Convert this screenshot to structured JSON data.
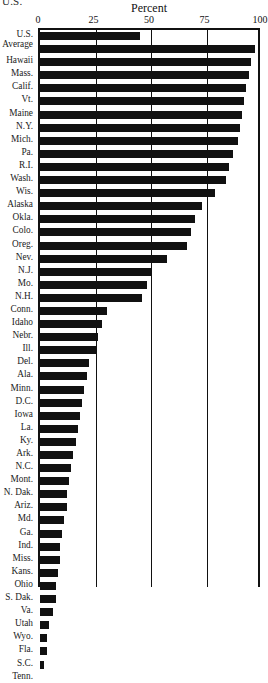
{
  "top_cut_text": "U.S.",
  "chart_data": {
    "type": "bar",
    "orientation": "horizontal",
    "title": "Percent",
    "xlabel": "Percent",
    "ylabel": "",
    "xlim": [
      0,
      100
    ],
    "ticks": [
      0,
      25,
      50,
      75,
      100
    ],
    "tick_labels": [
      "0",
      "25",
      "50",
      "75",
      "100"
    ],
    "grid": true,
    "legend": "none",
    "categories": [
      "U.S. Average",
      "Hawaii",
      "Mass.",
      "Calif.",
      "Vt.",
      "Maine",
      "N.Y.",
      "Mich.",
      "Pa.",
      "R.I.",
      "Wash.",
      "Wis.",
      "Alaska",
      "Okla.",
      "Colo.",
      "Oreg.",
      "Nev.",
      "N.J.",
      "Mo.",
      "N.H.",
      "Conn.",
      "Idaho",
      "Nebr.",
      "Ill.",
      "Del.",
      "Ala.",
      "Minn.",
      "D.C.",
      "Iowa",
      "La.",
      "Ky.",
      "Ark.",
      "N.C.",
      "Mont.",
      "N. Dak.",
      "Ariz.",
      "Md.",
      "Ga.",
      "Ind.",
      "Miss.",
      "Kans.",
      "Ohio",
      "S. Dak.",
      "Va.",
      "Utah",
      "Wyo.",
      "Fla.",
      "S.C.",
      "Tenn."
    ],
    "values": [
      45,
      97,
      95,
      94,
      93,
      92,
      91,
      90,
      89,
      87,
      85,
      84,
      79,
      73,
      70,
      68,
      66,
      57,
      50,
      48,
      46,
      30,
      28,
      26,
      25,
      22,
      21,
      20,
      19,
      18,
      17,
      16,
      15,
      14,
      13,
      12,
      12,
      11,
      10,
      9,
      9,
      8,
      7,
      7,
      6,
      4,
      3,
      3,
      2
    ]
  }
}
